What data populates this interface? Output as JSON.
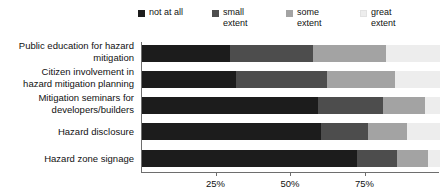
{
  "chart_data": {
    "type": "bar",
    "title": "",
    "subtitle": "",
    "orientation": "horizontal",
    "stacked": true,
    "xlabel": "",
    "ylabel": "",
    "xlim": [
      0,
      100
    ],
    "grid": false,
    "legend_position": "top",
    "xticks": [
      "25%",
      "50%",
      "75%"
    ],
    "xtick_values": [
      25,
      50,
      75
    ],
    "categories": [
      "Public education for hazard\nmitigation",
      "Citizen involvement in\nhazard mitigation planning",
      "Mitigation seminars for\ndevelopers/builders",
      "Hazard disclosure",
      "Hazard zone signage"
    ],
    "series": [
      {
        "name": "not at all",
        "color": "#1c1c1c",
        "values": [
          29.5,
          31.5,
          59.0,
          60.0,
          72.0
        ]
      },
      {
        "name": "small\nextent",
        "color": "#4d4d4d",
        "values": [
          28.0,
          30.5,
          22.0,
          16.0,
          13.5
        ]
      },
      {
        "name": "some\nextent",
        "color": "#a3a3a3",
        "values": [
          24.5,
          23.0,
          14.0,
          13.0,
          10.5
        ]
      },
      {
        "name": "great\nextent",
        "color": "#ededed",
        "values": [
          18.0,
          15.0,
          5.0,
          11.0,
          4.0
        ]
      }
    ]
  },
  "legend": {
    "items": [
      {
        "label": "not at all",
        "color": "#1c1c1c",
        "icon": "square-swatch"
      },
      {
        "label": "small\nextent",
        "color": "#4d4d4d",
        "icon": "square-swatch"
      },
      {
        "label": "some\nextent",
        "color": "#a3a3a3",
        "icon": "square-swatch"
      },
      {
        "label": "great\nextent",
        "color": "#ededed",
        "icon": "square-swatch"
      }
    ]
  },
  "axis": {
    "line_color": "#6e6e6e",
    "ticks": [
      {
        "label": "25%",
        "value": 25
      },
      {
        "label": "50%",
        "value": 50
      },
      {
        "label": "75%",
        "value": 75
      }
    ]
  }
}
